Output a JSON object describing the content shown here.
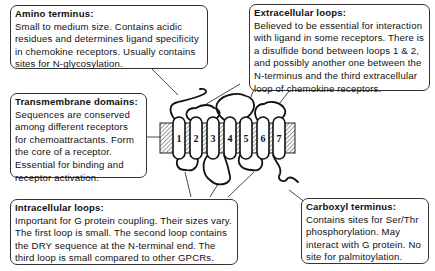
{
  "callouts": {
    "amino": {
      "title": "Amino terminus:",
      "body": "Small to medium size. Contains acidic residues and determines ligand specificity in chemokine receptors. Usually contains sites for N-glycosylation."
    },
    "extracellular": {
      "title": "Extracellular loops:",
      "body": "Believed to be essential for interaction with ligand in some receptors. There is a disulfide bond between loops 1 & 2, and possibly another one between the N-terminus and the third extracellular loop of chemokine receptors."
    },
    "transmembrane": {
      "title": "Transmembrane domains:",
      "body": "Sequences are conserved among different receptors for chemoattractants. Form the core of a receptor. Essential for binding and receptor activation."
    },
    "intracellular": {
      "title": "Intracellular loops:",
      "body": "Important for G protein coupling. Their sizes vary. The first loop is small. The second loop contains the DRY sequence at the N-terminal end. The third loop is small compared to other GPCRs."
    },
    "carboxyl": {
      "title": "Carboxyl terminus:",
      "body": "Contains sites for Ser/Thr phosphorylation. May interact with G protein. No site for palmitoylation."
    }
  },
  "helices": [
    "1",
    "2",
    "3",
    "4",
    "5",
    "6",
    "7"
  ]
}
